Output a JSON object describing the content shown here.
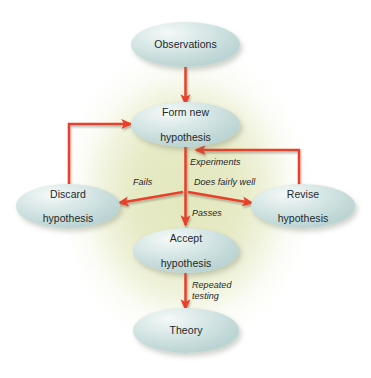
{
  "diagram": {
    "type": "flowchart",
    "colors": {
      "arrow": "#e8402a",
      "node_fill_light": "#f4f9f8",
      "node_fill_dark": "#b6d0d0",
      "background_glow": "#e2e6ba",
      "canvas": "#ffffff",
      "text": "#23282b"
    },
    "nodes": [
      {
        "id": "observations",
        "label": "Observations",
        "lines": [
          "Observations"
        ]
      },
      {
        "id": "form-new-hypothesis",
        "label": "Form new hypothesis",
        "lines": [
          "Form new",
          "hypothesis"
        ]
      },
      {
        "id": "discard-hypothesis",
        "label": "Discard hypothesis",
        "lines": [
          "Discard",
          "hypothesis"
        ]
      },
      {
        "id": "revise-hypothesis",
        "label": "Revise hypothesis",
        "lines": [
          "Revise",
          "hypothesis"
        ]
      },
      {
        "id": "accept-hypothesis",
        "label": "Accept hypothesis",
        "lines": [
          "Accept",
          "hypothesis"
        ]
      },
      {
        "id": "theory",
        "label": "Theory",
        "lines": [
          "Theory"
        ]
      }
    ],
    "edge_labels": {
      "experiments": "Experiments",
      "fails": "Fails",
      "does_fairly_well": "Does fairly well",
      "passes": "Passes",
      "repeated_testing_line1": "Repeated",
      "repeated_testing_line2": "testing"
    },
    "edges": [
      {
        "from": "observations",
        "to": "form-new-hypothesis",
        "label": ""
      },
      {
        "from": "form-new-hypothesis",
        "to": "branch-junction",
        "label": "Experiments"
      },
      {
        "from": "branch-junction",
        "to": "discard-hypothesis",
        "label": "Fails"
      },
      {
        "from": "branch-junction",
        "to": "accept-hypothesis",
        "label": "Passes"
      },
      {
        "from": "branch-junction",
        "to": "revise-hypothesis",
        "label": "Does fairly well"
      },
      {
        "from": "discard-hypothesis",
        "to": "form-new-hypothesis",
        "label": ""
      },
      {
        "from": "revise-hypothesis",
        "to": "form-new-hypothesis",
        "label": ""
      },
      {
        "from": "accept-hypothesis",
        "to": "theory",
        "label": "Repeated testing"
      }
    ]
  }
}
